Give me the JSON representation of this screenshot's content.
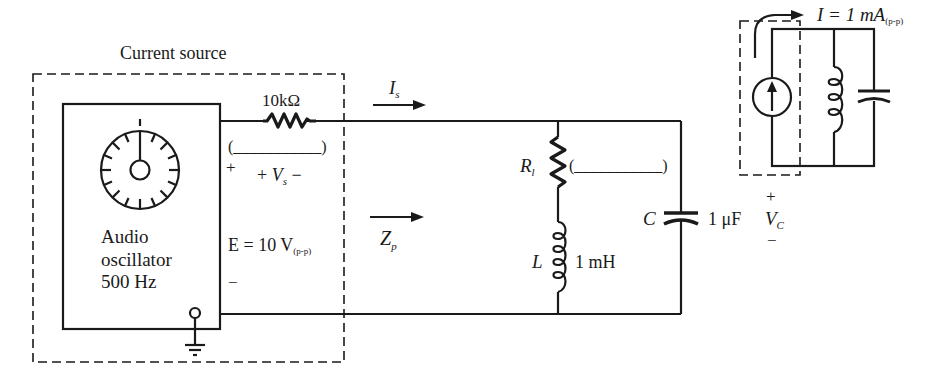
{
  "diagram": {
    "type": "circuit-schematic",
    "colors": {
      "ink": "#1a1a1a",
      "background": "#ffffff"
    },
    "source_box": {
      "title": "Current source",
      "oscillator": {
        "line1": "Audio",
        "line2": "oscillator",
        "line3": "500 Hz"
      },
      "series_resistor": "10kΩ",
      "blank_value": "(___________)",
      "plus_sign": "+",
      "minus_sign": "−",
      "vs_label": {
        "prefix": "+ ",
        "symbol": "V",
        "sub": "s",
        "suffix": " −"
      },
      "emf": {
        "text": "E = 10 V",
        "sub": "(p-p)"
      }
    },
    "arrows": {
      "is_label": {
        "symbol": "I",
        "sub": "s"
      },
      "zp_label": {
        "symbol": "Z",
        "sub": "p"
      }
    },
    "tank": {
      "rl_label": {
        "symbol": "R",
        "sub": "l"
      },
      "rl_blank": "(___________)",
      "l_symbol": "L",
      "l_value": "1 mH",
      "c_symbol": "C",
      "c_value": "1 μF",
      "vc": {
        "plus": "+",
        "symbol": "V",
        "sub": "C",
        "minus": "−"
      }
    },
    "inset": {
      "current_label": {
        "text": "I = 1 mA",
        "sub": "(p-p)"
      }
    }
  }
}
